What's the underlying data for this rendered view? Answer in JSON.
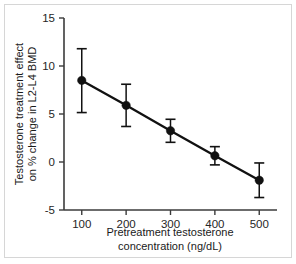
{
  "chart_data": {
    "type": "line",
    "title": "",
    "subtitle": "",
    "xlabel_line1": "Pretreatment testosterone",
    "xlabel_line2": "concentration (ng/dL)",
    "ylabel_line1": "Testosterone treatment effect",
    "ylabel_line2": "on % change in L2-L4 BMD",
    "x": [
      100,
      200,
      300,
      400,
      500
    ],
    "xtick_labels": [
      "100",
      "200",
      "300",
      "400",
      "500"
    ],
    "ytick_labels": [
      "15",
      "10",
      "5",
      "0",
      "-5"
    ],
    "yticks": [
      15,
      10,
      5,
      0,
      -5
    ],
    "xlim": [
      60,
      540
    ],
    "ylim": [
      -5,
      15
    ],
    "grid": false,
    "legend": "none",
    "marker_color": "#111111",
    "line_color": "#111111",
    "axis_color": "#3b3b3b",
    "background_color": "#ffffff",
    "frame_color": "#d6d6d6",
    "series": [
      {
        "name": "Testosterone treatment effect",
        "values": [
          8.5,
          5.9,
          3.25,
          0.65,
          -1.9
        ],
        "error_low": [
          5.15,
          3.7,
          2.05,
          -0.3,
          -3.7
        ],
        "error_high": [
          11.8,
          8.1,
          4.45,
          1.6,
          -0.1
        ],
        "error_minus": [
          3.35,
          2.2,
          1.2,
          0.95,
          1.8
        ],
        "error_plus": [
          3.3,
          2.2,
          1.2,
          0.95,
          1.8
        ]
      }
    ],
    "points": [
      {
        "x": 100,
        "y": 8.5,
        "low": 5.15,
        "high": 11.8
      },
      {
        "x": 200,
        "y": 5.9,
        "low": 3.7,
        "high": 8.1
      },
      {
        "x": 300,
        "y": 3.25,
        "low": 2.05,
        "high": 4.45
      },
      {
        "x": 400,
        "y": 0.65,
        "low": -0.3,
        "high": 1.6
      },
      {
        "x": 500,
        "y": -1.9,
        "low": -3.7,
        "high": -0.1
      }
    ]
  }
}
